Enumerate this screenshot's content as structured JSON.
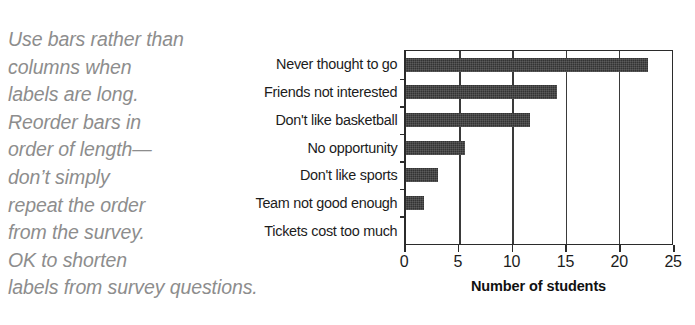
{
  "annotation": {
    "lines": [
      "Use bars rather than",
      "columns when",
      "labels are long.",
      "Reorder bars in",
      "order of length—",
      "don’t simply",
      "repeat the order",
      "from the survey.",
      "OK to shorten",
      "labels from survey questions."
    ]
  },
  "chart_data": {
    "type": "bar",
    "orientation": "horizontal",
    "title": "",
    "subtitle": "",
    "xlabel": "Number of students",
    "ylabel": "",
    "categories": [
      "Never thought to go",
      "Friends not interested",
      "Don't like basketball",
      "No opportunity",
      "Don't like sports",
      "Team not good enough",
      "Tickets cost too much"
    ],
    "values": [
      22.5,
      14,
      11.5,
      5.5,
      3,
      1.7,
      0
    ],
    "xlim": [
      0,
      25
    ],
    "xticks": [
      0,
      5,
      10,
      15,
      20,
      25
    ],
    "xtick_labels": [
      "0",
      "5",
      "10",
      "15",
      "20",
      "25"
    ],
    "grid": "vertical",
    "legend": "none",
    "bar_color": "#333333",
    "axis_color": "#2b2b2b",
    "annotation_color": "#8d8d8d"
  }
}
